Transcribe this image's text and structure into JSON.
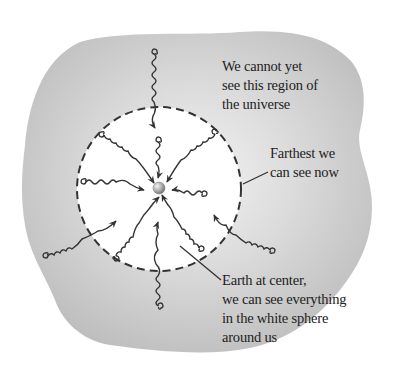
{
  "diagram": {
    "labels": {
      "unseen_region": [
        "We cannot yet",
        "see this region of",
        "the universe"
      ],
      "horizon": [
        "Farthest we",
        "can see now"
      ],
      "earth": [
        "Earth at center,",
        "we can see everything",
        "in the white sphere",
        "around us"
      ]
    },
    "elements": {
      "outer_region": "gray universe region (unobservable)",
      "observable_sphere": "white sphere bounded by dashed circle",
      "earth": "small sphere at center",
      "light_rays": 12
    },
    "colors": {
      "region_fill": "#c4c4c4",
      "region_highlight": "#ededed",
      "sphere_fill": "#ffffff",
      "stroke": "#333333",
      "text": "#222222"
    }
  }
}
